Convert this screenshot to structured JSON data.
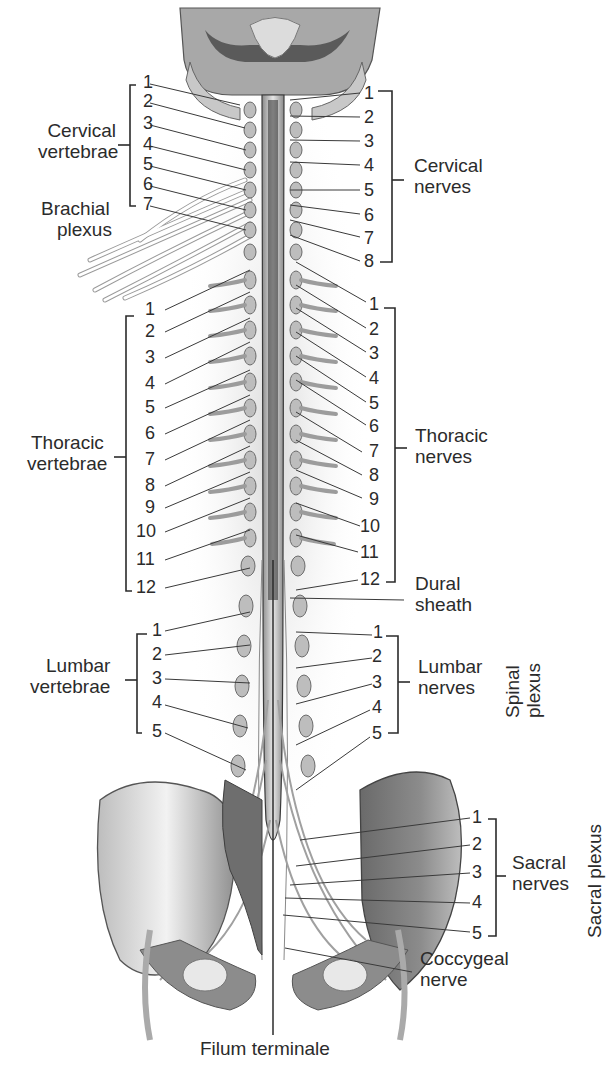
{
  "figure": {
    "colors": {
      "ink": "#2b2b2b",
      "bone": "#9a9a9a",
      "shade": "#5e5e5e",
      "background": "#ffffff"
    }
  },
  "left_labels": {
    "cervical_vertebrae": {
      "line1": "Cervical",
      "line2": "vertebrae",
      "numbers": [
        "1",
        "2",
        "3",
        "4",
        "5",
        "6",
        "7"
      ]
    },
    "brachial_plexus": {
      "line1": "Brachial",
      "line2": "plexus"
    },
    "thoracic_vertebrae": {
      "line1": "Thoracic",
      "line2": "vertebrae",
      "numbers": [
        "1",
        "2",
        "3",
        "4",
        "5",
        "6",
        "7",
        "8",
        "9",
        "10",
        "11",
        "12"
      ]
    },
    "lumbar_vertebrae": {
      "line1": "Lumbar",
      "line2": "vertebrae",
      "numbers": [
        "1",
        "2",
        "3",
        "4",
        "5"
      ]
    }
  },
  "right_labels": {
    "cervical_nerves": {
      "line1": "Cervical",
      "line2": "nerves",
      "numbers": [
        "1",
        "2",
        "3",
        "4",
        "5",
        "6",
        "7",
        "8"
      ]
    },
    "thoracic_nerves": {
      "line1": "Thoracic",
      "line2": "nerves",
      "numbers": [
        "1",
        "2",
        "3",
        "4",
        "5",
        "6",
        "7",
        "8",
        "9",
        "10",
        "11",
        "12"
      ]
    },
    "dural_sheath": {
      "line1": "Dural",
      "line2": "sheath"
    },
    "lumbar_nerves": {
      "line1": "Lumbar",
      "line2": "nerves",
      "numbers": [
        "1",
        "2",
        "3",
        "4",
        "5"
      ]
    },
    "spinal_plexus": {
      "line1": "Spinal",
      "line2": "plexus"
    },
    "sacral_nerves": {
      "line1": "Sacral",
      "line2": "nerves",
      "numbers": [
        "1",
        "2",
        "3",
        "4",
        "5"
      ]
    },
    "sacral_plexus": {
      "label": "Sacral plexus"
    },
    "coccygeal_nerve": {
      "line1": "Coccygeal",
      "line2": "nerve"
    }
  },
  "bottom_labels": {
    "filum_terminale": "Filum terminale"
  }
}
